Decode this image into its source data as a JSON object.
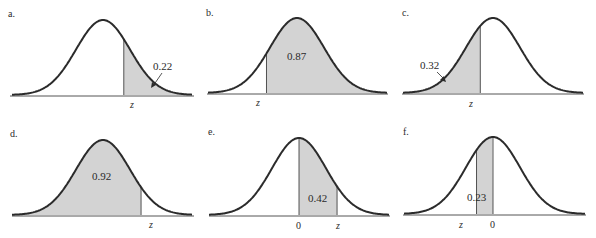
{
  "colors": {
    "curve": "#2b2b2b",
    "shade": "#d3d3d3",
    "axis": "#555555",
    "text": "#2a2a2a"
  },
  "chart_data": [
    {
      "type": "area",
      "title": "a.",
      "description": "Standard normal curve, right tail shaded beyond z",
      "shaded_region": "right_of_z",
      "area_value": "0.22",
      "area_label_style": "arrow",
      "ticks": [
        "z"
      ],
      "z_approx": 0.77
    },
    {
      "type": "area",
      "title": "b.",
      "description": "Standard normal curve, region right of z shaded",
      "shaded_region": "right_of_z",
      "area_value": "0.87",
      "area_label_style": "inside",
      "ticks": [
        "z"
      ],
      "z_approx": -1.13
    },
    {
      "type": "area",
      "title": "c.",
      "description": "Standard normal curve, left tail shaded up to z",
      "shaded_region": "left_of_z",
      "area_value": "0.32",
      "area_label_style": "arrow",
      "ticks": [
        "z"
      ],
      "z_approx": -0.47
    },
    {
      "type": "area",
      "title": "d.",
      "description": "Standard normal curve, region left of z shaded",
      "shaded_region": "left_of_z",
      "area_value": "0.92",
      "area_label_style": "inside",
      "ticks": [
        "z"
      ],
      "z_approx": 1.41
    },
    {
      "type": "area",
      "title": "e.",
      "description": "Standard normal curve, region between 0 and z shaded",
      "shaded_region": "between_0_and_z",
      "area_value": "0.42",
      "area_label_style": "inside",
      "ticks": [
        "0",
        "z"
      ],
      "z_approx": 1.41
    },
    {
      "type": "area",
      "title": "f.",
      "description": "Standard normal curve, region between z and 0 shaded",
      "shaded_region": "between_z_and_0",
      "area_value": "0.23",
      "area_label_style": "inside",
      "ticks": [
        "z",
        "0"
      ],
      "z_approx": -0.61
    }
  ],
  "panels": [
    {
      "label": "a.",
      "area": "0.22",
      "z": "z"
    },
    {
      "label": "b.",
      "area": "0.87",
      "z": "z"
    },
    {
      "label": "c.",
      "area": "0.32",
      "z": "z"
    },
    {
      "label": "d.",
      "area": "0.92",
      "z": "z"
    },
    {
      "label": "e.",
      "area": "0.42",
      "z": "z",
      "zero": "0"
    },
    {
      "label": "f.",
      "area": "0.23",
      "z": "z",
      "zero": "0"
    }
  ]
}
